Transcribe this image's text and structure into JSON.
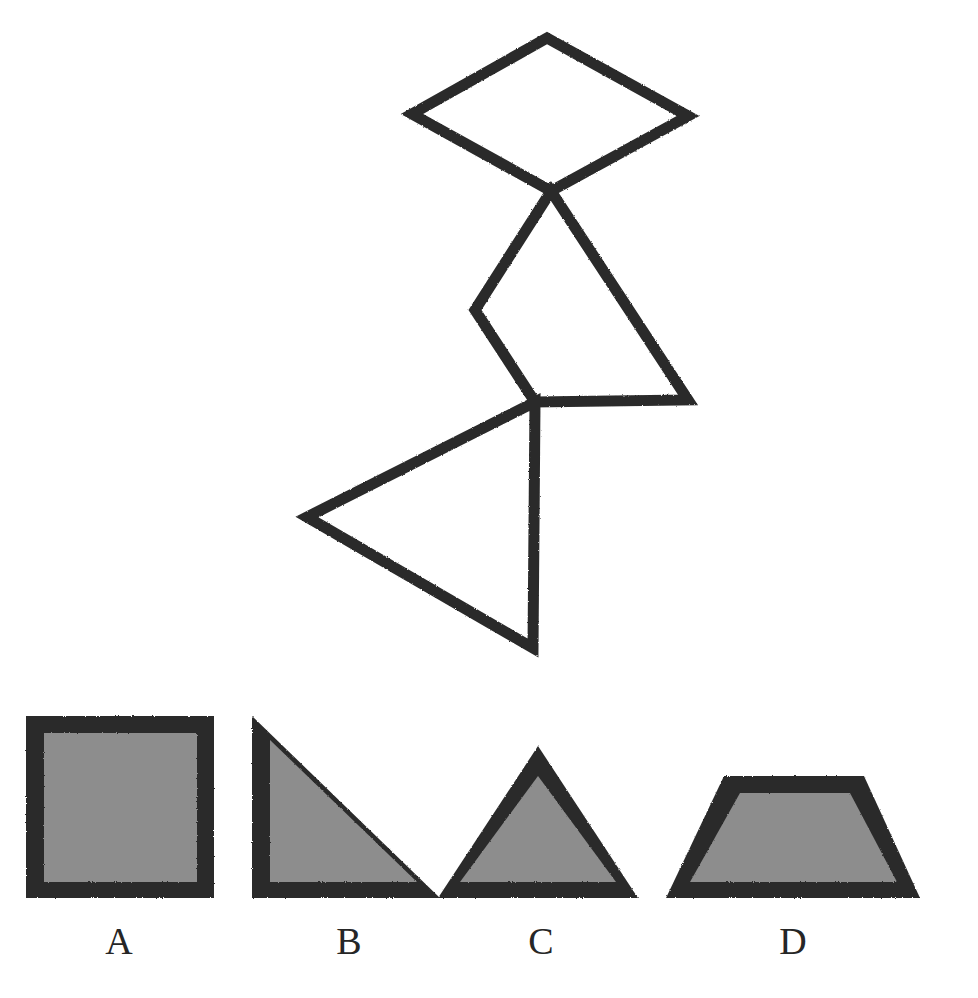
{
  "page": {
    "width": 978,
    "height": 998,
    "background": "#ffffff",
    "top_cut_text": "",
    "ink_color": "#2b2b2b",
    "fill_color": "#8d8d8d",
    "label_color": "#262626"
  },
  "figure": {
    "name": "folded-figure",
    "stroke_color": "#2b2b2b",
    "stroke_width": 11,
    "parts": [
      {
        "name": "diamond",
        "points": "547,38 688,116 551,191 412,114"
      },
      {
        "name": "middle-quad",
        "points": "551,191 688,400 535,402 475,310"
      },
      {
        "name": "lower-triangle",
        "points": "535,402 533,648 307,517"
      }
    ]
  },
  "options": [
    {
      "id": "a",
      "label": "A",
      "shape": "square",
      "outer_points": "12,16 200,16 200,198 12,198",
      "inner_points": "30,33 183,33 183,182 30,182",
      "width": 212,
      "height": 212
    },
    {
      "id": "b",
      "label": "B",
      "shape": "right-triangle",
      "outer_points": "8,16 8,198 196,198",
      "inner_points": "26,40 26,182 173,182",
      "width": 212,
      "height": 212
    },
    {
      "id": "c",
      "label": "C",
      "shape": "triangle",
      "outer_points": "104,46 204,198 4,198",
      "inner_points": "104,76 182,182 26,182",
      "width": 212,
      "height": 212
    },
    {
      "id": "d",
      "label": "D",
      "shape": "trapezoid",
      "outer_points": "72,76 212,76 268,198 14,198",
      "inner_points": "88,93 198,93 245,182 38,182",
      "width": 282,
      "height": 212
    }
  ]
}
